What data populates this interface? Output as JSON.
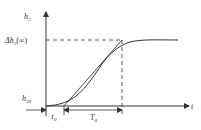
{
  "diagram": {
    "type": "step-response-curve",
    "colors": {
      "line": "#333333",
      "background": "#ffffff"
    },
    "labels": {
      "y_axis": "h",
      "y_axis_sub": "2",
      "x_axis": "t",
      "final_value": "Δh",
      "final_value_sub": "2",
      "final_value_suffix": "(∞)",
      "initial_value": "h",
      "initial_value_sub": "20",
      "dead_time": "τ",
      "dead_time_sub": "0",
      "time_constant": "T",
      "time_constant_sub": "0"
    },
    "elements": [
      "y-axis with arrow",
      "x-axis with arrow",
      "S-shaped response curve",
      "tangent line at inflection point",
      "dashed horizontal line at final value",
      "dashed vertical line at tangent intersection",
      "dimension arrows for τ0 and T0"
    ]
  }
}
